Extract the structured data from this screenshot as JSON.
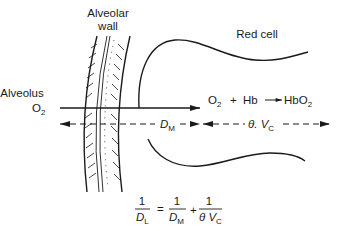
{
  "diagram": {
    "labels": {
      "alveolar_wall_line1": "Alveolar",
      "alveolar_wall_line2": "wall",
      "red_cell": "Red cell",
      "alveolus": "Alveolus",
      "o2_main": "O",
      "o2_sub": "2"
    },
    "reaction": {
      "o2": "O",
      "o2_sub": "2",
      "plus": "+",
      "hb": "Hb",
      "product": "HbO",
      "product_sub": "2"
    },
    "distances": {
      "membrane_main": "D",
      "membrane_sub": "M",
      "blood_theta": "θ. V",
      "blood_sub": "C"
    },
    "equation": {
      "lhs_num": "1",
      "lhs_den": "D",
      "lhs_den_sub": "L",
      "equals": "=",
      "term1_num": "1",
      "term1_den": "D",
      "term1_den_sub": "M",
      "plus": "+",
      "term2_num": "1",
      "term2_den": "θ V",
      "term2_den_sub": "C"
    },
    "colors": {
      "ink": "#1a1a1a",
      "background": "#ffffff"
    }
  }
}
